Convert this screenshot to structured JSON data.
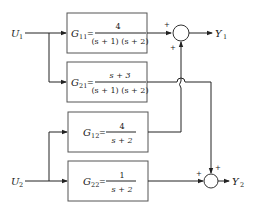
{
  "inputs": [
    {
      "name": "U",
      "sub": "1"
    },
    {
      "name": "U",
      "sub": "2"
    }
  ],
  "outputs": [
    {
      "name": "Y",
      "sub": "1"
    },
    {
      "name": "Y",
      "sub": "2"
    }
  ],
  "blocks": [
    {
      "label": "G",
      "sub": "11",
      "eq": "=",
      "numerator": "4",
      "denominator": "(s + 1) (s + 2)"
    },
    {
      "label": "G",
      "sub": "21",
      "eq": "=",
      "numerator": "s + 3",
      "denominator": "(s + 1) (s + 2)"
    },
    {
      "label": "G",
      "sub": "12",
      "eq": "=",
      "numerator": "4",
      "denominator": "s + 2"
    },
    {
      "label": "G",
      "sub": "22",
      "eq": "=",
      "numerator": "1",
      "denominator": "s + 2"
    }
  ],
  "summing_junctions": [
    {
      "id": "sum1",
      "signs": [
        "+",
        "+"
      ]
    },
    {
      "id": "sum2",
      "signs": [
        "+",
        "+"
      ]
    }
  ]
}
